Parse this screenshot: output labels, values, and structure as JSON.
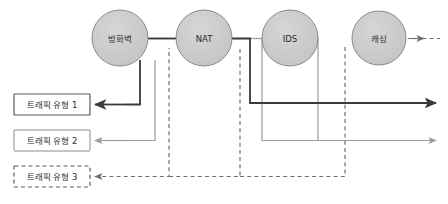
{
  "diagram": {
    "type": "network-traffic-flow-diagram",
    "canvas": {
      "width": 448,
      "height": 204,
      "background": "#ffffff"
    },
    "colors": {
      "node_fill": "#c9c9c9",
      "node_stroke": "#8a8a8a",
      "box_fill": "#ffffff",
      "box_stroke": "#5a5a5a",
      "flow_dark": "#3a3a3a",
      "flow_mid": "#8f8f8f",
      "flow_dashed": "#7d7d7d",
      "text": "#2b2b2b"
    },
    "nodes": [
      {
        "id": "firewall",
        "label": "방화벽",
        "shape": "circle",
        "cx": 120,
        "cy": 38,
        "r": 28
      },
      {
        "id": "nat",
        "label": "NAT",
        "shape": "circle",
        "cx": 204,
        "cy": 38,
        "r": 28
      },
      {
        "id": "ids",
        "label": "IDS",
        "shape": "circle",
        "cx": 290,
        "cy": 38,
        "r": 28
      },
      {
        "id": "caching",
        "label": "캐싱",
        "shape": "circle",
        "cx": 379,
        "cy": 38,
        "r": 27
      }
    ],
    "boxes": [
      {
        "id": "traffic-type-1",
        "label": "트래픽 유형 1",
        "x": 14,
        "y": 94,
        "width": 76,
        "height": 21,
        "border": "solid"
      },
      {
        "id": "traffic-type-2",
        "label": "트래픽 유형 2",
        "x": 14,
        "y": 130,
        "width": 76,
        "height": 21,
        "border": "solid"
      },
      {
        "id": "traffic-type-3",
        "label": "트래픽 유형 3",
        "x": 14,
        "y": 166,
        "width": 76,
        "height": 21,
        "border": "dashed"
      }
    ],
    "flows": [
      {
        "id": "flow-1-dark",
        "from": "traffic-type-1",
        "style": "solid-dark",
        "arrow": true
      },
      {
        "id": "flow-2-mid",
        "from": "traffic-type-2",
        "style": "solid-mid",
        "arrow": true
      },
      {
        "id": "flow-3-dashed",
        "from": "traffic-type-3",
        "style": "dashed",
        "arrow": true
      },
      {
        "id": "caching-output",
        "from": "caching",
        "style": "dashed",
        "arrow": true
      },
      {
        "id": "output-dark",
        "to": "right-edge",
        "style": "solid-dark",
        "arrow": true
      },
      {
        "id": "output-mid",
        "to": "right-edge",
        "style": "solid-mid",
        "arrow": true
      }
    ]
  }
}
